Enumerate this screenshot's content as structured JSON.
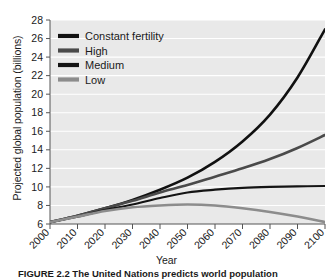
{
  "figure": {
    "caption": "FIGURE 2.2  The United Nations predicts world population",
    "x_axis_title": "Year",
    "y_axis_title": "Projected global population (billions)"
  },
  "chart_data": {
    "type": "line",
    "title": "",
    "xlabel": "Year",
    "ylabel": "Projected global population (billions)",
    "xlim": [
      2000,
      2100
    ],
    "ylim": [
      6,
      28
    ],
    "xticks": [
      2000,
      2010,
      2020,
      2030,
      2040,
      2050,
      2060,
      2070,
      2080,
      2090,
      2100
    ],
    "xtick_labels": [
      "2000",
      "2010",
      "2020",
      "2030",
      "2040",
      "2050",
      "2060",
      "2070",
      "2080",
      "2090",
      "2100"
    ],
    "yticks": [
      6,
      8,
      10,
      12,
      14,
      16,
      18,
      20,
      22,
      24,
      26,
      28
    ],
    "ytick_labels": [
      "6",
      "8",
      "10",
      "12",
      "14",
      "16",
      "18",
      "20",
      "22",
      "24",
      "26",
      "28"
    ],
    "grid": "horizontal-white",
    "plot_background": "#e9e9e9",
    "legend_position": "top-left",
    "x": [
      2000,
      2010,
      2020,
      2030,
      2040,
      2050,
      2060,
      2070,
      2080,
      2090,
      2100
    ],
    "series": [
      {
        "name": "Constant fertility",
        "color": "#111111",
        "width": 2.6,
        "values": [
          6.2,
          6.9,
          7.7,
          8.6,
          9.7,
          11.0,
          12.7,
          14.9,
          17.8,
          21.8,
          27.0
        ]
      },
      {
        "name": "High",
        "color": "#4a4a4a",
        "width": 2.6,
        "values": [
          6.2,
          6.9,
          7.7,
          8.5,
          9.4,
          10.2,
          11.1,
          12.0,
          13.0,
          14.2,
          15.6
        ]
      },
      {
        "name": "Medium",
        "color": "#141414",
        "width": 2.2,
        "values": [
          6.2,
          6.8,
          7.5,
          8.1,
          8.8,
          9.4,
          9.7,
          9.9,
          10.0,
          10.05,
          10.1
        ]
      },
      {
        "name": "Low",
        "color": "#8c8c8c",
        "width": 2.6,
        "values": [
          6.2,
          6.8,
          7.4,
          7.8,
          8.0,
          8.1,
          8.0,
          7.7,
          7.3,
          6.8,
          6.2
        ]
      }
    ]
  },
  "legend": {
    "items": [
      {
        "label": "Constant fertility",
        "color": "#111111"
      },
      {
        "label": "High",
        "color": "#4a4a4a"
      },
      {
        "label": "Medium",
        "color": "#141414"
      },
      {
        "label": "Low",
        "color": "#8c8c8c"
      }
    ]
  }
}
